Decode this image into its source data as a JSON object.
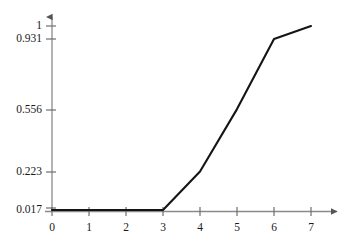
{
  "chart_data": {
    "type": "line",
    "title": "",
    "subtitle": "",
    "xlabel": "",
    "ylabel": "",
    "x": [
      0,
      1,
      2,
      3,
      4,
      5,
      6,
      7
    ],
    "values": [
      0.017,
      0.017,
      0.017,
      0.017,
      0.223,
      0.556,
      0.931,
      1
    ],
    "series": [
      {
        "name": "",
        "values": [
          0.017,
          0.017,
          0.017,
          0.017,
          0.223,
          0.556,
          0.931,
          1
        ]
      }
    ],
    "xlim": [
      0,
      7
    ],
    "ylim": [
      0.017,
      1
    ],
    "x_tick_labels": [
      "0",
      "1",
      "2",
      "3",
      "4",
      "5",
      "6",
      "7"
    ],
    "x_tick_values": [
      0,
      1,
      2,
      3,
      4,
      5,
      6,
      7
    ],
    "y_tick_labels": [
      "1",
      "0.931",
      "0.556",
      "0.223",
      "0.017"
    ],
    "y_tick_values": [
      1,
      0.931,
      0.556,
      0.223,
      0.017
    ],
    "grid": false,
    "legend": false,
    "legend_position": "none",
    "annotations": [],
    "colors": {
      "line": "#151515",
      "axis": "#8a8a8a",
      "tick_mark": "#6e6e6e",
      "label_text": "#1a1a1a",
      "background": "#ffffff"
    }
  }
}
